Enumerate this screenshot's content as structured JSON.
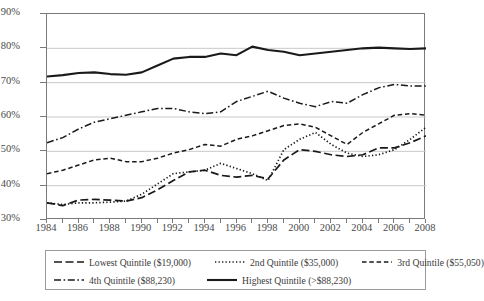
{
  "chart_data": {
    "type": "line",
    "title": "",
    "xlabel": "",
    "ylabel": "",
    "xlim": [
      1984,
      2008
    ],
    "ylim": [
      30,
      90
    ],
    "ytick_labels": [
      "30%",
      "40%",
      "50%",
      "60%",
      "70%",
      "80%",
      "90%"
    ],
    "ytick_values": [
      30,
      40,
      50,
      60,
      70,
      80,
      90
    ],
    "xtick_labels": [
      "1984",
      "1986",
      "1988",
      "1990",
      "1992",
      "1994",
      "1996",
      "1998",
      "2000",
      "2002",
      "2004",
      "2006",
      "2008"
    ],
    "xtick_values": [
      1984,
      1986,
      1988,
      1990,
      1992,
      1994,
      1996,
      1998,
      2000,
      2002,
      2004,
      2006,
      2008
    ],
    "x": [
      1984,
      1985,
      1986,
      1987,
      1988,
      1989,
      1990,
      1991,
      1992,
      1993,
      1994,
      1995,
      1996,
      1997,
      1998,
      1999,
      2000,
      2001,
      2002,
      2003,
      2004,
      2005,
      2006,
      2007,
      2008
    ],
    "grid": "horizontal",
    "legend_position": "bottom",
    "series": [
      {
        "name": "Lowest Quintile ($19,000)",
        "style": "long-dash",
        "values": [
          35.0,
          34.2,
          35.8,
          36.0,
          35.8,
          35.5,
          36.5,
          38.8,
          41.5,
          44.0,
          44.5,
          43.0,
          42.5,
          43.0,
          42.0,
          47.5,
          50.5,
          50.0,
          49.0,
          48.5,
          49.0,
          51.0,
          51.0,
          52.5,
          54.5
        ]
      },
      {
        "name": "2nd Quintile ($35,000)",
        "style": "dotted",
        "values": [
          35.0,
          34.5,
          35.0,
          35.0,
          35.2,
          35.5,
          37.5,
          40.5,
          43.5,
          44.0,
          44.5,
          46.5,
          45.0,
          43.5,
          41.5,
          50.5,
          53.5,
          55.5,
          52.0,
          49.5,
          48.5,
          49.0,
          50.5,
          53.5,
          57.0
        ]
      },
      {
        "name": "3rd Quintile ($55,050)",
        "style": "short-dash",
        "values": [
          43.5,
          44.5,
          46.0,
          47.5,
          48.0,
          47.0,
          47.0,
          48.0,
          49.5,
          50.5,
          52.0,
          51.5,
          53.5,
          54.5,
          56.0,
          57.5,
          58.0,
          57.0,
          54.5,
          52.0,
          55.5,
          58.0,
          60.5,
          61.0,
          60.5
        ]
      },
      {
        "name": "4th Quintile ($88,230)",
        "style": "dash-dot",
        "values": [
          52.5,
          54.0,
          56.5,
          58.5,
          59.5,
          60.5,
          61.5,
          62.5,
          62.5,
          61.5,
          61.0,
          61.5,
          64.5,
          66.0,
          67.5,
          65.5,
          64.0,
          63.0,
          64.5,
          64.0,
          66.5,
          68.5,
          69.5,
          69.0,
          69.0
        ]
      },
      {
        "name": "Highest Quintile (>$88,230)",
        "style": "solid",
        "values": [
          71.8,
          72.2,
          72.8,
          73.0,
          72.5,
          72.3,
          73.0,
          75.0,
          77.0,
          77.5,
          77.5,
          78.5,
          78.0,
          80.5,
          79.5,
          79.0,
          78.0,
          78.5,
          79.0,
          79.5,
          80.0,
          80.2,
          80.0,
          79.8,
          80.0
        ]
      }
    ]
  },
  "legend": {
    "rows": [
      [
        {
          "label": "Lowest Quintile ($19,000)",
          "style": "long-dash"
        },
        {
          "label": "2nd Quintile ($35,000)",
          "style": "dotted"
        },
        {
          "label": "3rd Quintile ($55,050)",
          "style": "short-dash"
        }
      ],
      [
        {
          "label": "4th Quintile ($88,230)",
          "style": "dash-dot"
        },
        {
          "label": "Highest Quintile (>$88,230)",
          "style": "solid"
        }
      ]
    ]
  },
  "colors": {
    "line": "#1a1a1a",
    "grid": "#c9c9c9",
    "axis": "#7a7a7a",
    "text": "#3b3b3b"
  }
}
